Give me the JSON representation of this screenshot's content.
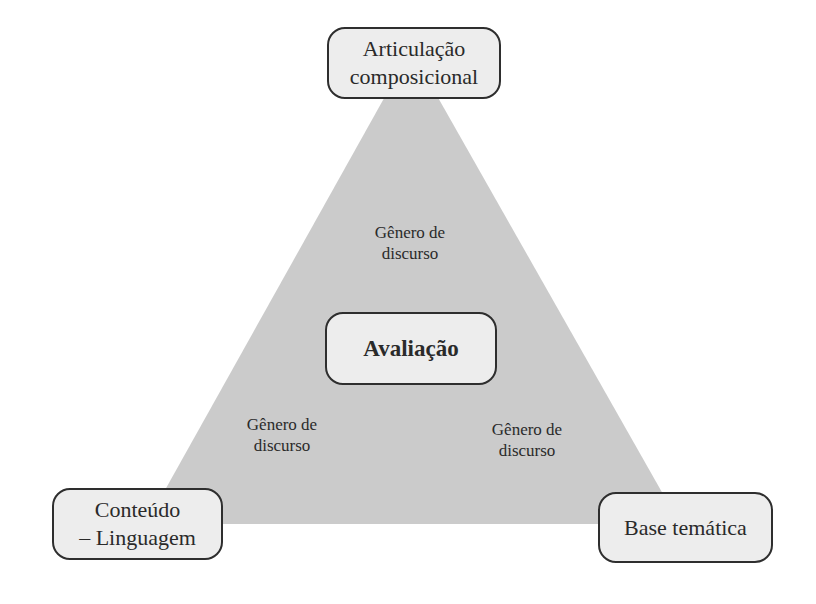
{
  "diagram": {
    "type": "triangle-concept-map",
    "colors": {
      "triangle_fill": "#cbcbcb",
      "node_fill": "#ededed",
      "node_border": "#2e2e2e",
      "text": "#2a2a2a",
      "background": "#ffffff"
    },
    "vertices": {
      "top": {
        "lines": [
          "Articulação",
          "composicional"
        ]
      },
      "bottom_left": {
        "lines": [
          "Conteúdo",
          "– Linguagem"
        ]
      },
      "bottom_right": {
        "lines": [
          "Base temática"
        ]
      }
    },
    "center": {
      "lines": [
        "Avaliação"
      ]
    },
    "edge_labels": {
      "top": {
        "lines": [
          "Gênero de",
          "discurso"
        ]
      },
      "left": {
        "lines": [
          "Gênero de",
          "discurso"
        ]
      },
      "right": {
        "lines": [
          "Gênero de",
          "discurso"
        ]
      }
    }
  }
}
